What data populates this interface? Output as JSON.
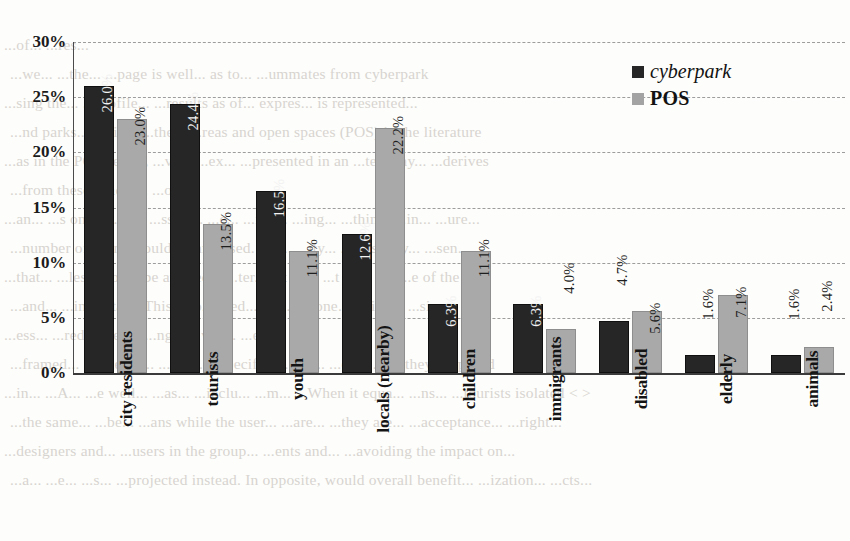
{
  "chart_data": {
    "type": "bar",
    "title": "",
    "xlabel": "",
    "ylabel": "",
    "ylim": [
      0,
      30
    ],
    "ytick_labels": [
      "30%",
      "25%",
      "20%",
      "15%",
      "10%",
      "5%",
      "0%"
    ],
    "ytick_values": [
      30,
      25,
      20,
      15,
      10,
      5,
      0
    ],
    "grid": true,
    "legend_position": "top-right",
    "categories": [
      "city residents",
      "tourists",
      "youth",
      "locals (nearby)",
      "children",
      "immigrants",
      "disabled",
      "elderly",
      "animals"
    ],
    "series": [
      {
        "name": "cyberpark",
        "color": "#262626",
        "values": [
          26.0,
          24.4,
          16.5,
          12.6,
          6.3,
          6.3,
          4.7,
          1.6,
          1.6
        ],
        "value_labels": [
          "26.0%",
          "24.4%",
          "16.5%",
          "12.6%",
          "6.3%",
          "6.3%",
          "4.7%",
          "1.6%",
          "1.6%"
        ]
      },
      {
        "name": "POS",
        "color": "#a9a9a9",
        "values": [
          23.0,
          13.5,
          11.1,
          22.2,
          11.1,
          4.0,
          5.6,
          7.1,
          2.4
        ],
        "value_labels": [
          "23.0%",
          "13.5%",
          "11.1%",
          "22.2%",
          "11.1%",
          "4.0%",
          "5.6%",
          "7.1%",
          "2.4%"
        ]
      }
    ]
  },
  "legend": {
    "entries": [
      {
        "label": "cyberpark",
        "color": "#262626"
      },
      {
        "label": "POS",
        "color": "#a3a3a3"
      }
    ]
  },
  "background_text": {
    "lines": [
      "...of... ...res...",
      "...we... ...the... ...page is well... as to... ...ummates from cyberpark",
      "...sing the... ...profile... ...results as of... expres... is represented...",
      "...nd parks... ...ding, ...the... ...reas and open spaces (POS) in the literature",
      "...as in the POS sector, ...vely ...ex... ...presented in an ...ted way... ...derives",
      "...from these spaces... ...only",
      "...an... ...s on a... ...y... ...ss of... ...e... ...ign... ...ing... ...thin... ...in... ...ure...",
      "...number of users should be analysed. Yet... ...ity... ...sers may... ...sen...",
      "...that... ...less should be applied... ...ter... ...t de... ...t with a... ...e of the",
      "...and... ...important. This also... ...ed... ...th... ...one... ...ting... ...sion...",
      "...ess... ...red... ...ed... ...ng... ...ved... ...er...",
      "...framed... ...sidered... ...ing... ...specifica... ...o... ...ed... ...all they proposed",
      "...in... ...A... ...e well... ...as... ...inclu... ...m... ...When it equa... ...ns... ...tourists isolated <  >",
      "...the same... ...be... ...ans while the user... ...are... ...they are... ...acceptance... ...right...",
      "...designers and... ...users in the group... ...ents and... ...avoiding the impact on...",
      "...a... ...e... ...s... ...projected instead. In opposite, would overall benefit... ...ization... ...cts..."
    ]
  }
}
